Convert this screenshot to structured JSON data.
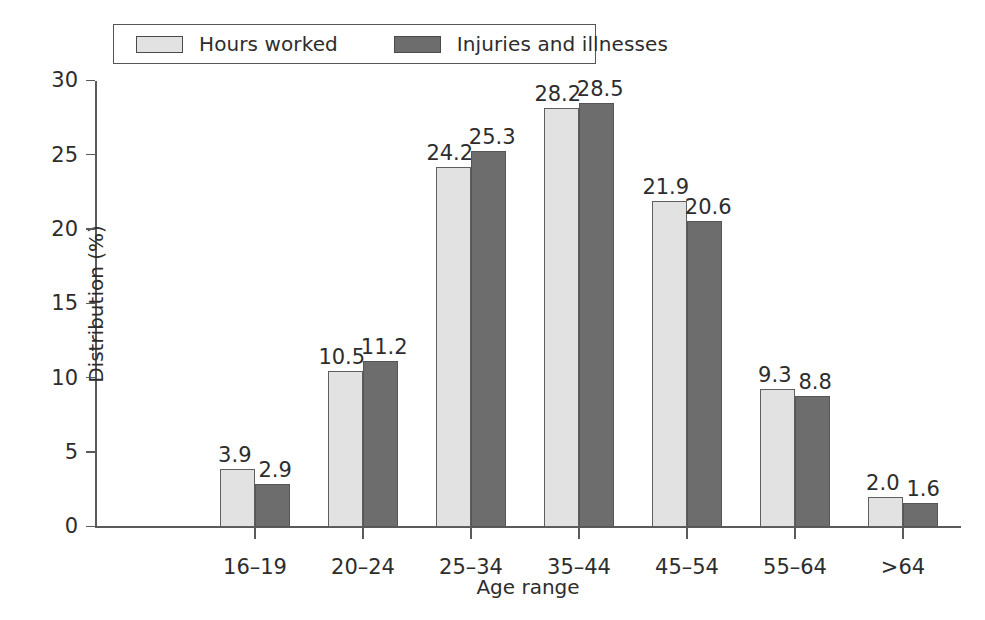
{
  "chart_data": {
    "type": "bar",
    "title": "",
    "xlabel": "Age range",
    "ylabel": "Distribution (%)",
    "categories": [
      "16–19",
      "20–24",
      "25–34",
      "35–44",
      "45–54",
      "55–64",
      ">64"
    ],
    "series": [
      {
        "name": "Hours worked",
        "color": "#e2e2e2",
        "values": [
          3.9,
          10.5,
          24.2,
          28.2,
          21.9,
          9.3,
          2.0
        ],
        "labels": [
          "3.9",
          "10.5",
          "24.2",
          "28.2",
          "21.9",
          "9.3",
          "2.0"
        ]
      },
      {
        "name": "Injuries and illnesses",
        "color": "#6d6d6d",
        "values": [
          2.9,
          11.2,
          25.3,
          28.5,
          20.6,
          8.8,
          1.6
        ],
        "labels": [
          "2.9",
          "11.2",
          "25.3",
          "28.5",
          "20.6",
          "8.8",
          "1.6"
        ]
      }
    ],
    "ylim": [
      0,
      30
    ],
    "yticks": [
      0,
      5,
      10,
      15,
      20,
      25,
      30
    ],
    "ytick_labels": [
      "0",
      "5",
      "10",
      "15",
      "20",
      "25",
      "30"
    ],
    "grid": false,
    "legend_position": "top-left"
  },
  "legend": {
    "entries": [
      {
        "label": "Hours worked",
        "swatch": "light"
      },
      {
        "label": "Injuries and illnesses",
        "swatch": "dark"
      }
    ]
  }
}
